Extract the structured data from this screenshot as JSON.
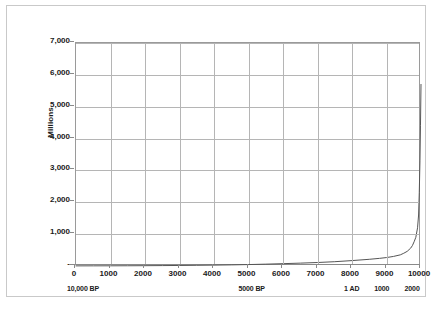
{
  "chart_data": {
    "type": "line",
    "title": "",
    "subtitle": "",
    "xlabel": "",
    "ylabel": "Millions",
    "xlim": [
      0,
      10000
    ],
    "ylim": [
      0,
      7000
    ],
    "grid": true,
    "legend": "none",
    "y_ticks": [
      "7,000",
      "6,000",
      "5,000",
      "4,000",
      "3,000",
      "2,000",
      "1,000",
      "-"
    ],
    "y_tick_values": [
      7000,
      6000,
      5000,
      4000,
      3000,
      2000,
      1000,
      0
    ],
    "x_ticks": [
      "0",
      "1000",
      "2000",
      "3000",
      "4000",
      "5000",
      "6000",
      "7000",
      "8000",
      "9000",
      "10000"
    ],
    "x_tick_values": [
      0,
      1000,
      2000,
      3000,
      4000,
      5000,
      6000,
      7000,
      8000,
      9000,
      10000
    ],
    "x_annotations": [
      {
        "label": "10,000 BP",
        "x": 260
      },
      {
        "label": "5000 BP",
        "x": 5150
      },
      {
        "label": "1 AD",
        "x": 8050
      },
      {
        "label": "1000",
        "x": 8920
      },
      {
        "label": "2000",
        "x": 9800
      }
    ],
    "series": [
      {
        "name": "World population",
        "color": "#555555",
        "x": [
          0,
          500,
          1000,
          1500,
          2000,
          2500,
          3000,
          3500,
          4000,
          4500,
          5000,
          5500,
          6000,
          6500,
          7000,
          7500,
          8000,
          8500,
          8800,
          9000,
          9200,
          9400,
          9500,
          9600,
          9700,
          9750,
          9800,
          9850,
          9900,
          9930,
          9950,
          9970,
          9985,
          10000
        ],
        "values": [
          4,
          5,
          6,
          8,
          10,
          13,
          17,
          22,
          28,
          35,
          45,
          58,
          73,
          90,
          110,
          135,
          170,
          210,
          240,
          265,
          300,
          350,
          400,
          460,
          560,
          640,
          760,
          900,
          1200,
          1600,
          2300,
          3300,
          4400,
          5700
        ]
      }
    ]
  },
  "axis": {
    "y_title": "Millions"
  }
}
